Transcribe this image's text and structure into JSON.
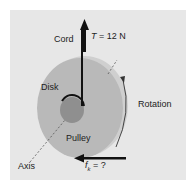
{
  "diagram": {
    "labels": {
      "cord": "Cord",
      "tension_symbol": "T",
      "tension_eq": " = 12 N",
      "disk": "Disk",
      "pulley": "Pulley",
      "rotation": "Rotation",
      "axis": "Axis",
      "friction_symbol": "f",
      "friction_subscript": "k",
      "friction_eq": " = ?"
    },
    "colors": {
      "background": "#e7e7e7",
      "disk_face": "#b9b9b9",
      "disk_rim": "#cfcfcf",
      "pulley": "#8f8f8f",
      "arrow": "#111111"
    }
  }
}
